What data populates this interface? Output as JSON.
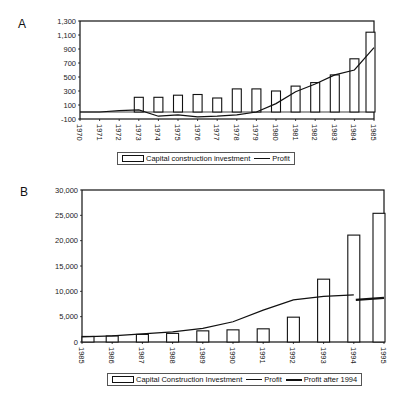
{
  "panels": {
    "a": {
      "label": "A"
    },
    "b": {
      "label": "B"
    }
  },
  "legend_a": {
    "bar": "Capital construction investment",
    "line": "Profit"
  },
  "legend_b": {
    "bar": "Capital Construction Investment",
    "line": "Profit",
    "thick": "Profit after 1994"
  },
  "chart_data": [
    {
      "type": "bar",
      "panel": "A",
      "title": "",
      "xlabel": "",
      "ylabel": "",
      "ylim": [
        -100,
        1300
      ],
      "yticks": [
        "1,300",
        "1,100",
        "900",
        "700",
        "500",
        "300",
        "100",
        "-100"
      ],
      "categories": [
        "1970",
        "1971",
        "1972",
        "1973",
        "1974",
        "1975",
        "1976",
        "1977",
        "1978",
        "1979",
        "1980",
        "1981",
        "1982",
        "1983",
        "1984",
        "1985"
      ],
      "series": [
        {
          "name": "Capital construction investment",
          "type": "bar",
          "values": [
            null,
            null,
            null,
            210,
            210,
            240,
            250,
            200,
            330,
            330,
            300,
            370,
            420,
            530,
            760,
            1140
          ]
        },
        {
          "name": "Profit",
          "type": "line",
          "values": [
            0,
            0,
            20,
            30,
            -60,
            -40,
            -70,
            -60,
            -40,
            0,
            120,
            290,
            400,
            530,
            600,
            920
          ]
        }
      ],
      "legend_position": "bottom"
    },
    {
      "type": "bar",
      "panel": "B",
      "title": "",
      "xlabel": "",
      "ylabel": "",
      "ylim": [
        0,
        30000
      ],
      "yticks": [
        "30,000",
        "25,000",
        "20,000",
        "15,000",
        "10,000",
        "5,000",
        "0"
      ],
      "categories": [
        "1985",
        "1986",
        "1987",
        "1988",
        "1989",
        "1990",
        "1991",
        "1992",
        "1993",
        "1994",
        "1995"
      ],
      "series": [
        {
          "name": "Capital Construction Investment",
          "type": "bar",
          "values": [
            1100,
            1200,
            1500,
            1700,
            2200,
            2400,
            2600,
            4900,
            12400,
            21100,
            25400
          ]
        },
        {
          "name": "Profit",
          "type": "line",
          "values": [
            1000,
            1200,
            1600,
            2000,
            2700,
            4000,
            6300,
            8300,
            9000,
            9300,
            null
          ]
        },
        {
          "name": "Profit after 1994",
          "type": "line",
          "values": [
            null,
            null,
            null,
            null,
            null,
            null,
            null,
            null,
            null,
            8300,
            8700
          ]
        }
      ],
      "legend_position": "bottom"
    }
  ]
}
